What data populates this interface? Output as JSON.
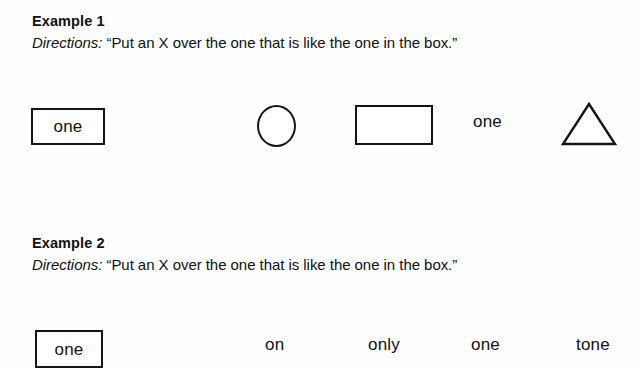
{
  "document": {
    "background_color": "#fefefe",
    "ink_color": "#101010"
  },
  "examples": [
    {
      "title": "Example 1",
      "directions_label": "Directions:",
      "directions_text": "“Put an X over the one that is like the one in the box.”",
      "stimulus_word": "one",
      "options": [
        {
          "kind": "circle",
          "label": "circle-shape"
        },
        {
          "kind": "rectangle",
          "label": "rectangle-shape"
        },
        {
          "kind": "word",
          "label": "one"
        },
        {
          "kind": "triangle",
          "label": "triangle-shape"
        }
      ]
    },
    {
      "title": "Example 2",
      "directions_label": "Directions:",
      "directions_text": "“Put an X over the one that is like the one in the box.”",
      "stimulus_word": "one",
      "options": [
        {
          "kind": "word",
          "label": "on"
        },
        {
          "kind": "word",
          "label": "only"
        },
        {
          "kind": "word",
          "label": "one"
        },
        {
          "kind": "word",
          "label": "tone"
        }
      ]
    }
  ]
}
